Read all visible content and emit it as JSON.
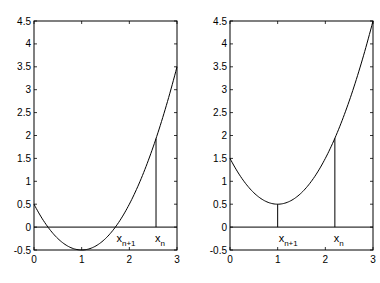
{
  "chart_data": [
    {
      "type": "line",
      "title": "",
      "xlabel": "",
      "ylabel": "",
      "xlim": [
        0,
        3
      ],
      "ylim": [
        -0.5,
        4.5
      ],
      "x_ticks": [
        "0",
        "1",
        "2",
        "3"
      ],
      "y_ticks": [
        "-0.5",
        "0",
        "0.5",
        "1",
        "1.5",
        "2",
        "2.5",
        "3",
        "3.5",
        "4",
        "4.5"
      ],
      "grid": false,
      "legend": null,
      "series": [
        {
          "name": "f(x) = (x-1)^2 - 0.5",
          "x": [
            0,
            0.5,
            1,
            1.5,
            2,
            2.5,
            3
          ],
          "y": [
            0.5,
            -0.25,
            -0.5,
            -0.25,
            0.5,
            1.75,
            3.5
          ]
        }
      ],
      "annotations": [
        {
          "label": "x",
          "sub": "n",
          "x": 2.56,
          "y_top": 1.93,
          "type": "vertical-line"
        },
        {
          "label": "x",
          "sub": "n+1",
          "x": 1.71,
          "type": "root-label"
        }
      ],
      "zero_line": true
    },
    {
      "type": "line",
      "title": "",
      "xlabel": "",
      "ylabel": "",
      "xlim": [
        0,
        3
      ],
      "ylim": [
        -0.5,
        4.5
      ],
      "x_ticks": [
        "0",
        "1",
        "2",
        "3"
      ],
      "y_ticks": [
        "-0.5",
        "0",
        "0.5",
        "1",
        "1.5",
        "2",
        "2.5",
        "3",
        "3.5",
        "4",
        "4.5"
      ],
      "grid": false,
      "legend": null,
      "series": [
        {
          "name": "g(x) = (x-1)^2 + 0.5",
          "x": [
            0,
            0.5,
            1,
            1.5,
            2,
            2.5,
            3
          ],
          "y": [
            1.5,
            0.75,
            0.5,
            0.75,
            1.5,
            2.75,
            4.5
          ]
        }
      ],
      "annotations": [
        {
          "label": "x",
          "sub": "n",
          "x": 2.2,
          "y_top": 1.94,
          "type": "vertical-line"
        },
        {
          "label": "x",
          "sub": "n+1",
          "x": 1.0,
          "y_top": 0.5,
          "type": "vertical-line"
        }
      ],
      "zero_line": true
    }
  ],
  "left": {
    "ann_n_main": "x",
    "ann_n_sub": "n",
    "ann_n1_main": "x",
    "ann_n1_sub": "n+1"
  },
  "right": {
    "ann_n_main": "x",
    "ann_n_sub": "n",
    "ann_n1_main": "x",
    "ann_n1_sub": "n+1"
  }
}
